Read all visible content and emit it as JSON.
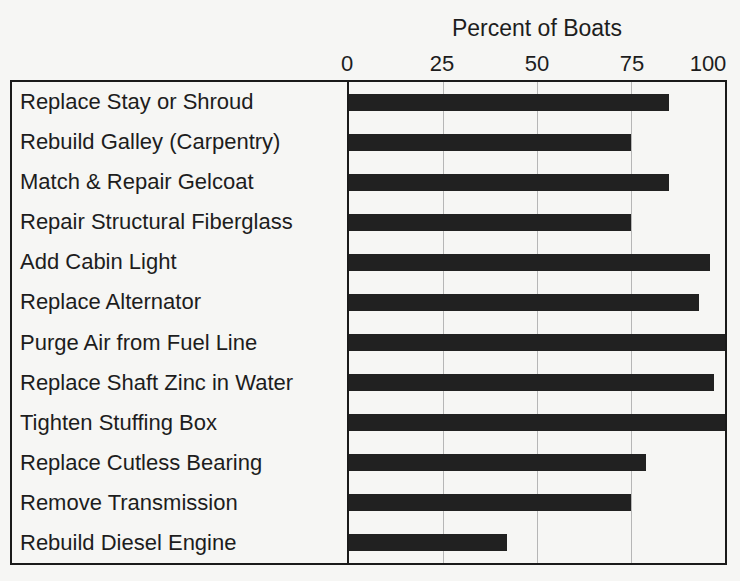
{
  "chart_data": {
    "type": "bar",
    "orientation": "horizontal",
    "title": "Percent of Boats",
    "axis": {
      "position": "top",
      "ticks": [
        "0",
        "25",
        "50",
        "75",
        "100"
      ],
      "tick_values": [
        0,
        25,
        50,
        75,
        100
      ],
      "range": [
        0,
        100
      ],
      "gridlines": [
        25,
        50,
        75
      ]
    },
    "categories": [
      "Replace Stay or Shroud",
      "Rebuild Galley (Carpentry)",
      "Match & Repair Gelcoat",
      "Repair Structural Fiberglass",
      "Add Cabin Light",
      "Replace Alternator",
      "Purge Air from Fuel Line",
      "Replace Shaft Zinc in Water",
      "Tighten Stuffing Box",
      "Replace Cutless Bearing",
      "Remove Transmission",
      "Rebuild Diesel Engine"
    ],
    "values": [
      85,
      75,
      85,
      75,
      96,
      93,
      102,
      97,
      100,
      79,
      75,
      42
    ],
    "bar_color": "#212121",
    "gridline_color": "#b6b6b6",
    "frame_color": "#1a1a1a",
    "background_color": "#f6f6f4"
  }
}
